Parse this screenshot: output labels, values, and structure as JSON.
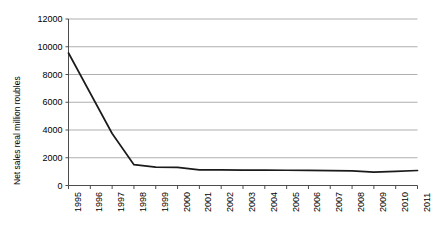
{
  "chart_data": {
    "type": "line",
    "title": "",
    "xlabel": "",
    "ylabel": "Net sales real million roubles",
    "categories": [
      "1995",
      "1996",
      "1997",
      "1998",
      "1999",
      "2000",
      "2001",
      "2002",
      "2003",
      "2004",
      "2005",
      "2006",
      "2007",
      "2008",
      "2009",
      "2010",
      "2011"
    ],
    "x": [
      1995,
      1996,
      1997,
      1998,
      1999,
      2000,
      2001,
      2002,
      2003,
      2004,
      2005,
      2006,
      2007,
      2008,
      2009,
      2010,
      2011
    ],
    "values": [
      9550,
      6650,
      3750,
      1500,
      1330,
      1300,
      1130,
      1120,
      1110,
      1110,
      1100,
      1090,
      1070,
      1060,
      960,
      1020,
      1080
    ],
    "series": [
      {
        "name": "Net sales real million roubles",
        "values": [
          9550,
          6650,
          3750,
          1500,
          1330,
          1300,
          1130,
          1120,
          1110,
          1110,
          1100,
          1090,
          1070,
          1060,
          960,
          1020,
          1080
        ]
      }
    ],
    "yticks": [
      0,
      2000,
      4000,
      6000,
      8000,
      10000,
      12000
    ],
    "ytick_labels": [
      "0",
      "2000",
      "4000",
      "6000",
      "8000",
      "10000",
      "12000"
    ],
    "ylim": [
      0,
      12000
    ],
    "xlim": [
      1995,
      2011
    ],
    "grid": "horizontal",
    "legend": "none",
    "line_color": "#1a1a1a",
    "grid_color": "#9a9a9a",
    "axis_color": "#4d4d4d",
    "background": "#ffffff"
  }
}
